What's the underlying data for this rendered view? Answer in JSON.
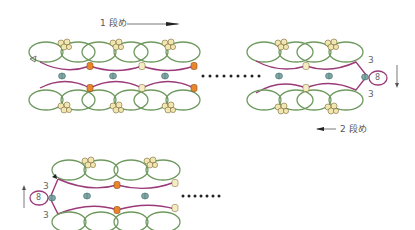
{
  "labels": {
    "row1": "1 段め",
    "row2": "2 段め"
  },
  "counts": {
    "top_right_upper": "3",
    "top_right_lower": "3",
    "top_right_ring": "8",
    "bottom_left_upper": "3",
    "bottom_left_lower": "3",
    "bottom_left_ring": "8"
  },
  "colors": {
    "ring_green": "#6f9a5f",
    "chain_purple": "#9a3a78",
    "bead_orange": "#e8862e",
    "bead_cream": "#f2e6b0",
    "bead_teal": "#7fa9a6",
    "text": "#555555"
  }
}
